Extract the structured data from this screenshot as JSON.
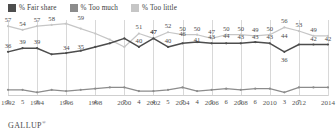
{
  "legend": {
    "items": [
      {
        "label": "% Fair share",
        "color": "#4d4d4d",
        "icon": "legend-swatch-icon"
      },
      {
        "label": "% Too much",
        "color": "#8c8c8c",
        "icon": "legend-swatch-icon"
      },
      {
        "label": "% Too little",
        "color": "#c6c6c6",
        "icon": "legend-swatch-icon"
      }
    ]
  },
  "footer": {
    "brand": "GALLUP",
    "mark": "®"
  },
  "chart_data": {
    "type": "line",
    "title": "",
    "subtitle": "",
    "xlabel": "",
    "ylabel": "",
    "ylim": [
      0,
      62
    ],
    "grid": true,
    "legend_position": "top-left",
    "x": [
      1992,
      1993,
      1994,
      1995,
      1996,
      1997,
      1998,
      1999,
      2000,
      2001,
      2002,
      2003,
      2004,
      2005,
      2006,
      2007,
      2008,
      2009,
      2010,
      2011,
      2012,
      2013,
      2014
    ],
    "tick_labels": [
      "1992",
      "1994",
      "1996",
      "1998",
      "2000",
      "2002",
      "2004",
      "2006",
      "2008",
      "2010",
      "2012",
      "2014"
    ],
    "tick_values": [
      1992,
      1994,
      1996,
      1998,
      2000,
      2002,
      2004,
      2006,
      2008,
      2010,
      2012,
      2014
    ],
    "series": [
      {
        "name": "% Too little",
        "color": "#c6c6c6",
        "values": [
          57,
          54,
          57,
          58,
          59,
          55,
          51,
          46,
          40,
          51,
          47,
          52,
          50,
          50,
          47,
          50,
          50,
          49,
          50,
          56,
          53,
          49,
          49
        ]
      },
      {
        "name": "% Fair share",
        "color": "#4d4d4d",
        "values": [
          36,
          39,
          39,
          34,
          35,
          37,
          40,
          43,
          47,
          40,
          47,
          40,
          43,
          44,
          43,
          43,
          43,
          44,
          43,
          36,
          42,
          42,
          42
        ]
      },
      {
        "name": "% Too much",
        "color": "#8c8c8c",
        "values": [
          5,
          5,
          3,
          5,
          4,
          5,
          6,
          7,
          7,
          4,
          4,
          5,
          7,
          4,
          5,
          6,
          5,
          6,
          6,
          3,
          7,
          7,
          7
        ]
      }
    ],
    "point_labels": [
      {
        "series": "% Too little",
        "x": 1992,
        "value": 57
      },
      {
        "series": "% Too little",
        "x": 1993,
        "value": 54
      },
      {
        "series": "% Too little",
        "x": 1994,
        "value": 57
      },
      {
        "series": "% Too little",
        "x": 1995,
        "value": 58
      },
      {
        "series": "% Too little",
        "x": 1997,
        "value": 59
      },
      {
        "series": "% Too little",
        "x": 2001,
        "value": 51
      },
      {
        "series": "% Too little",
        "x": 2002,
        "value": 47
      },
      {
        "series": "% Too little",
        "x": 2003,
        "value": 52
      },
      {
        "series": "% Too little",
        "x": 2004,
        "value": 50
      },
      {
        "series": "% Too little",
        "x": 2005,
        "value": 50
      },
      {
        "series": "% Too little",
        "x": 2006,
        "value": 47
      },
      {
        "series": "% Too little",
        "x": 2007,
        "value": 50
      },
      {
        "series": "% Too little",
        "x": 2008,
        "value": 50
      },
      {
        "series": "% Too little",
        "x": 2009,
        "value": 49
      },
      {
        "series": "% Too little",
        "x": 2010,
        "value": 50
      },
      {
        "series": "% Too little",
        "x": 2011,
        "value": 56
      },
      {
        "series": "% Too little",
        "x": 2012,
        "value": 53
      },
      {
        "series": "% Too little",
        "x": 2013,
        "value": 49
      },
      {
        "series": "% Fair share",
        "x": 1992,
        "value": 36
      },
      {
        "series": "% Fair share",
        "x": 1993,
        "value": 39
      },
      {
        "series": "% Fair share",
        "x": 1994,
        "value": 39
      },
      {
        "series": "% Fair share",
        "x": 1996,
        "value": 34
      },
      {
        "series": "% Fair share",
        "x": 1997,
        "value": 35
      },
      {
        "series": "% Fair share",
        "x": 2001,
        "value": 40
      },
      {
        "series": "% Fair share",
        "x": 2002,
        "value": 47
      },
      {
        "series": "% Fair share",
        "x": 2003,
        "value": 40
      },
      {
        "series": "% Fair share",
        "x": 2004,
        "value": 46
      },
      {
        "series": "% Fair share",
        "x": 2005,
        "value": 41
      },
      {
        "series": "% Fair share",
        "x": 2006,
        "value": 43
      },
      {
        "series": "% Fair share",
        "x": 2007,
        "value": 44
      },
      {
        "series": "% Fair share",
        "x": 2008,
        "value": 43
      },
      {
        "series": "% Fair share",
        "x": 2009,
        "value": 43
      },
      {
        "series": "% Fair share",
        "x": 2010,
        "value": 43
      },
      {
        "series": "% Fair share",
        "x": 2011,
        "value": 44
      },
      {
        "series": "% Fair share",
        "x": 2011,
        "value": 36
      },
      {
        "series": "% Fair share",
        "x": 2013,
        "value": 42
      },
      {
        "series": "% Fair share",
        "x": 2014,
        "value": 42
      },
      {
        "series": "% Too much",
        "x": 1992,
        "value": 5
      },
      {
        "series": "% Too much",
        "x": 1993,
        "value": 5
      },
      {
        "series": "% Too much",
        "x": 1994,
        "value": 3
      },
      {
        "series": "% Too much",
        "x": 1996,
        "value": 5
      },
      {
        "series": "% Too much",
        "x": 1998,
        "value": 4
      },
      {
        "series": "% Too much",
        "x": 2000,
        "value": 7
      },
      {
        "series": "% Too much",
        "x": 2001,
        "value": 4
      },
      {
        "series": "% Too much",
        "x": 2002,
        "value": 4
      },
      {
        "series": "% Too much",
        "x": 2003,
        "value": 5
      },
      {
        "series": "% Too much",
        "x": 2004,
        "value": 7
      },
      {
        "series": "% Too much",
        "x": 2005,
        "value": 4
      },
      {
        "series": "% Too much",
        "x": 2006,
        "value": 5
      },
      {
        "series": "% Too much",
        "x": 2007,
        "value": 6
      },
      {
        "series": "% Too much",
        "x": 2008,
        "value": 5
      },
      {
        "series": "% Too much",
        "x": 2009,
        "value": 6
      },
      {
        "series": "% Too much",
        "x": 2011,
        "value": 3
      },
      {
        "series": "% Too much",
        "x": 2012,
        "value": 7
      }
    ]
  }
}
